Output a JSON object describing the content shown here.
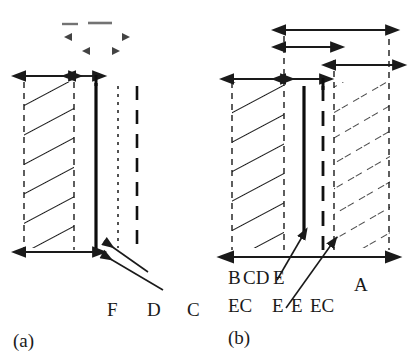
{
  "figure": {
    "type": "technical-cross-section-diagram",
    "background_color": "#ffffff",
    "ink_color": "#1a1a1a",
    "panel_count": 2
  },
  "panel_a": {
    "caption": "(a)",
    "labels": [
      {
        "text": "F",
        "x": 110,
        "y": 300
      },
      {
        "text": "D",
        "x": 150,
        "y": 300
      },
      {
        "text": "C",
        "x": 190,
        "y": 300
      }
    ],
    "regions": [
      {
        "name": "hatched-body",
        "hatch_style": "solid-diagonal",
        "x": 24,
        "y": 82,
        "width": 50,
        "height": 165
      }
    ],
    "vertical_lines": [
      {
        "name": "solid-edge-line",
        "style": "solid-thick",
        "x": 96,
        "y1": 83,
        "y2": 248
      },
      {
        "name": "fine-dotted-line",
        "style": "fine-dotted",
        "x": 118,
        "y1": 86,
        "y2": 248
      },
      {
        "name": "coarse-dashed-line",
        "style": "coarse-dashed",
        "x": 137,
        "y1": 86,
        "y2": 248
      },
      {
        "name": "left-boundary-dashed",
        "style": "fine-dashed",
        "x": 24,
        "y1": 82,
        "y2": 250
      },
      {
        "name": "right-boundary-dashed",
        "style": "fine-dashed",
        "x": 74,
        "y1": 82,
        "y2": 250
      }
    ],
    "dimensions": [
      {
        "name": "top-dim-wide",
        "x1": 24,
        "x2": 70,
        "y": 76
      },
      {
        "name": "top-dim-narrow",
        "x1": 74,
        "x2": 96,
        "y": 76
      },
      {
        "name": "bottom-dim",
        "x1": 24,
        "x2": 96,
        "y": 252
      }
    ],
    "faded_marks": [
      {
        "name": "faded-dim-left",
        "x1": 62,
        "x2": 76,
        "y": 24
      },
      {
        "name": "faded-dim-right",
        "x1": 88,
        "x2": 110,
        "y": 24
      },
      {
        "name": "faded-arrow-left-outer",
        "x": 66,
        "y": 37,
        "dir": "left"
      },
      {
        "name": "faded-arrow-right-outer",
        "x": 129,
        "y": 37,
        "dir": "right"
      },
      {
        "name": "faded-arrow-left-inner",
        "x": 83,
        "y": 51,
        "dir": "left"
      },
      {
        "name": "faded-arrow-right-inner",
        "x": 120,
        "y": 51,
        "dir": "right"
      }
    ],
    "leaders": [
      {
        "name": "leader-to-solid-line-upper",
        "from_x": 148,
        "from_y": 272,
        "to_x": 102,
        "to_y": 240
      },
      {
        "name": "leader-to-solid-line-lower",
        "from_x": 160,
        "from_y": 290,
        "to_x": 100,
        "to_y": 253
      }
    ]
  },
  "panel_b": {
    "caption": "(b)",
    "labels_row1": [
      {
        "text": "B",
        "x": 231,
        "y": 268
      },
      {
        "text": "CD",
        "x": 245,
        "y": 268
      },
      {
        "text": "E",
        "x": 274,
        "y": 268
      },
      {
        "text": "A",
        "x": 356,
        "y": 276
      }
    ],
    "labels_row2": [
      {
        "text": "EC",
        "x": 231,
        "y": 296
      },
      {
        "text": "E",
        "x": 274,
        "y": 296
      },
      {
        "text": "E",
        "x": 292,
        "y": 296
      },
      {
        "text": "EC",
        "x": 312,
        "y": 296
      }
    ],
    "regions": [
      {
        "name": "hatched-body-left",
        "hatch_style": "solid-diagonal",
        "x": 232,
        "y": 82,
        "width": 52,
        "height": 165
      },
      {
        "name": "hatched-body-right",
        "hatch_style": "dashed-diagonal",
        "x": 334,
        "y": 82,
        "width": 56,
        "height": 165
      }
    ],
    "vertical_lines": [
      {
        "name": "left-boundary-dashed",
        "style": "fine-dashed",
        "x": 232,
        "y1": 82,
        "y2": 250
      },
      {
        "name": "inner-left-dashed",
        "style": "fine-dashed",
        "x": 284,
        "y1": 36,
        "y2": 250
      },
      {
        "name": "solid-center-line",
        "style": "solid-thick",
        "x": 304,
        "y1": 86,
        "y2": 232
      },
      {
        "name": "coarse-dashed-line",
        "style": "coarse-dashed",
        "x": 323,
        "y1": 86,
        "y2": 250
      },
      {
        "name": "inner-right-dashed",
        "style": "fine-dashed",
        "x": 334,
        "y1": 60,
        "y2": 250
      },
      {
        "name": "right-boundary-dashed",
        "style": "fine-dashed",
        "x": 389,
        "y1": 28,
        "y2": 250
      }
    ],
    "dimensions": [
      {
        "name": "dim-top-full",
        "x1": 284,
        "x2": 389,
        "y": 30
      },
      {
        "name": "dim-second",
        "x1": 284,
        "x2": 334,
        "y": 47
      },
      {
        "name": "dim-third",
        "x1": 334,
        "x2": 392,
        "y": 65
      },
      {
        "name": "dim-left-body",
        "x1": 232,
        "x2": 284,
        "y": 79
      },
      {
        "name": "dim-gap",
        "x1": 284,
        "x2": 323,
        "y": 79
      },
      {
        "name": "dim-bottom-full",
        "x1": 232,
        "x2": 389,
        "y": 257
      }
    ],
    "leaders": [
      {
        "name": "leader-to-solid-line",
        "from_x": 277,
        "from_y": 278,
        "to_x": 300,
        "to_y": 238
      },
      {
        "name": "leader-to-dashed-line",
        "from_x": 286,
        "from_y": 305,
        "to_x": 330,
        "to_y": 246
      }
    ]
  }
}
